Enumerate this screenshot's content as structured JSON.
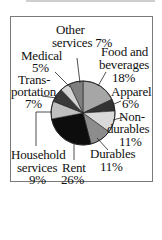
{
  "chart_data": {
    "type": "pie",
    "title": "",
    "start_angle_deg": 0,
    "direction": "clockwise",
    "slices": [
      {
        "label": "Food and beverages",
        "value": 18,
        "color": "#a6a6a6"
      },
      {
        "label": "Apparel",
        "value": 6,
        "color": "#333333"
      },
      {
        "label": "Non-durables",
        "value": 11,
        "color": "#d9d9d9"
      },
      {
        "label": "Durables",
        "value": 11,
        "color": "#8c8c8c"
      },
      {
        "label": "Rent",
        "value": 26,
        "color": "#0d0d0d"
      },
      {
        "label": "Household services",
        "value": 9,
        "color": "#bfbfbf"
      },
      {
        "label": "Transportation",
        "value": 7,
        "color": "#3a3a3a"
      },
      {
        "label": "Medical",
        "value": 5,
        "color": "#d4d4d4"
      },
      {
        "label": "Other services",
        "value": 7,
        "color": "#7f7f7f"
      }
    ],
    "legend": "none (leader-line labels)"
  },
  "labels": {
    "other_l1": "Other",
    "other_l2": "services 7%",
    "medical_l1": "Medical",
    "medical_l2": "5%",
    "transport_l1": "Trans-",
    "transport_l2": "portation",
    "transport_l3": "7%",
    "food_l1": "Food and",
    "food_l2": "beverages",
    "food_l3": "18%",
    "apparel_l1": "Apparel",
    "apparel_l2": "6%",
    "nondur_l1": "Non-",
    "nondur_l2": "durables",
    "nondur_l3": "11%",
    "durables_l1": "Durables",
    "durables_l2": "11%",
    "household_l1": "Household",
    "household_l2": "services",
    "household_l3": "9%",
    "rent_l1": "Rent",
    "rent_l2": "26%"
  }
}
